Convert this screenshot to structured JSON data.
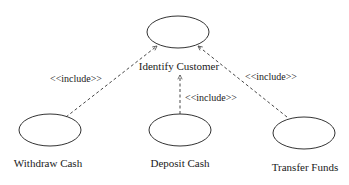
{
  "diagram": {
    "type": "uml-use-case",
    "colors": {
      "stroke": "#333333",
      "text": "#1a1a1a",
      "background": "#ffffff"
    },
    "use_cases": [
      {
        "id": "identify",
        "label": "Identify Customer"
      },
      {
        "id": "withdraw",
        "label": "Withdraw Cash"
      },
      {
        "id": "deposit",
        "label": "Deposit Cash"
      },
      {
        "id": "transfer",
        "label": "Transfer Funds"
      }
    ],
    "relationships": [
      {
        "from": "withdraw",
        "to": "identify",
        "stereotype": "<<include>>",
        "style": "dashed-arrow"
      },
      {
        "from": "deposit",
        "to": "identify",
        "stereotype": "<<include>>",
        "style": "dashed-arrow"
      },
      {
        "from": "transfer",
        "to": "identify",
        "stereotype": "<<include>>",
        "style": "dashed-arrow"
      }
    ]
  }
}
